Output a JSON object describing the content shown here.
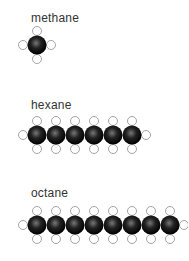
{
  "molecules": [
    {
      "name": "methane",
      "carbons": 1,
      "label_x": 31,
      "label_y": 11,
      "cx0": 37,
      "cy": 45,
      "spacing": 19
    },
    {
      "name": "hexane",
      "carbons": 6,
      "label_x": 31,
      "label_y": 98,
      "cx0": 37,
      "cy": 135,
      "spacing": 19
    },
    {
      "name": "octane",
      "carbons": 8,
      "label_x": 31,
      "label_y": 186,
      "cx0": 37,
      "cy": 225,
      "spacing": 19
    }
  ],
  "colors": {
    "carbon": "#111111",
    "carbon_highlight": "#777777",
    "hydrogen_fill": "#ffffff",
    "hydrogen_stroke": "#999999",
    "label": "#333333"
  }
}
